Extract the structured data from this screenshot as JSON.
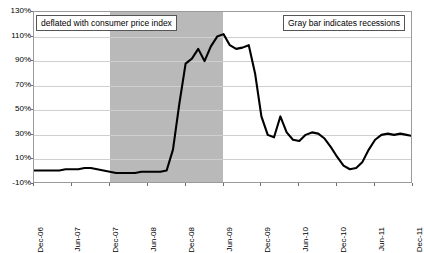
{
  "chart_data": {
    "type": "line",
    "title": "",
    "subtitle": "",
    "xlabel": "",
    "ylabel": "",
    "ylim": [
      -10,
      130
    ],
    "ytick_values": [
      130,
      110,
      90,
      70,
      50,
      30,
      10,
      -10
    ],
    "ytick_labels": [
      "130%",
      "110%",
      "90%",
      "70%",
      "50%",
      "30%",
      "10%",
      "-10%"
    ],
    "grid": true,
    "legend_position": "none",
    "x_tick_labels": [
      "Dec-06",
      "Jun-07",
      "Dec-07",
      "Jun-08",
      "Dec-08",
      "Jun-09",
      "Dec-09",
      "Jun-10",
      "Dec-10",
      "Jun-11",
      "Dec-11"
    ],
    "x_start": "Dec-06",
    "x_end": "Dec-11",
    "series": [
      {
        "name": "deflated with consumer price index",
        "color": "#000000",
        "x": [
          "Dec-06",
          "Jan-07",
          "Feb-07",
          "Mar-07",
          "Apr-07",
          "May-07",
          "Jun-07",
          "Jul-07",
          "Aug-07",
          "Sep-07",
          "Oct-07",
          "Nov-07",
          "Dec-07",
          "Jan-08",
          "Feb-08",
          "Mar-08",
          "Apr-08",
          "May-08",
          "Jun-08",
          "Jul-08",
          "Aug-08",
          "Sep-08",
          "Oct-08",
          "Nov-08",
          "Dec-08",
          "Jan-09",
          "Feb-09",
          "Mar-09",
          "Apr-09",
          "May-09",
          "Jun-09",
          "Jul-09",
          "Aug-09",
          "Sep-09",
          "Oct-09",
          "Nov-09",
          "Dec-09",
          "Jan-10",
          "Feb-10",
          "Mar-10",
          "Apr-10",
          "May-10",
          "Jun-10",
          "Jul-10",
          "Aug-10",
          "Sep-10",
          "Oct-10",
          "Nov-10",
          "Dec-10",
          "Jan-11",
          "Feb-11",
          "Mar-11",
          "Apr-11",
          "May-11",
          "Jun-11",
          "Jul-11",
          "Aug-11",
          "Sep-11",
          "Oct-11",
          "Nov-11",
          "Dec-11"
        ],
        "values": [
          1,
          1,
          1,
          1,
          1,
          2,
          2,
          2,
          3,
          3,
          2,
          1,
          0,
          -1,
          -1,
          -1,
          -1,
          0,
          0,
          0,
          0,
          1,
          18,
          55,
          88,
          92,
          100,
          90,
          102,
          110,
          112,
          103,
          100,
          101,
          103,
          80,
          45,
          30,
          28,
          45,
          32,
          26,
          25,
          30,
          32,
          31,
          27,
          20,
          12,
          5,
          2,
          3,
          8,
          18,
          26,
          30,
          31,
          30,
          31,
          30,
          29
        ]
      }
    ],
    "recession_band": {
      "label": "Gray bar indicates recessions",
      "start": "Dec-07",
      "end": "Jun-09",
      "color": "#b9b9b9"
    },
    "annotations": [
      {
        "id": "note-left",
        "text": "deflated with consumer price index"
      },
      {
        "id": "note-right",
        "text": "Gray bar indicates recessions"
      }
    ]
  },
  "axis": {
    "y": {
      "ticks": [
        {
          "label": "130%"
        },
        {
          "label": "110%"
        },
        {
          "label": "90%"
        },
        {
          "label": "70%"
        },
        {
          "label": "50%"
        },
        {
          "label": "30%"
        },
        {
          "label": "10%"
        },
        {
          "label": "-10%"
        }
      ]
    },
    "x": {
      "ticks": [
        {
          "label": "Dec-06"
        },
        {
          "label": "Jun-07"
        },
        {
          "label": "Dec-07"
        },
        {
          "label": "Jun-08"
        },
        {
          "label": "Dec-08"
        },
        {
          "label": "Jun-09"
        },
        {
          "label": "Dec-09"
        },
        {
          "label": "Jun-10"
        },
        {
          "label": "Dec-10"
        },
        {
          "label": "Jun-11"
        },
        {
          "label": "Dec-11"
        }
      ]
    }
  },
  "colors": {
    "line": "#000000",
    "recession": "#b9b9b9",
    "grid": "#cfcfcf",
    "frame": "#9a9a9a",
    "background": "#ffffff",
    "text": "#000000"
  }
}
